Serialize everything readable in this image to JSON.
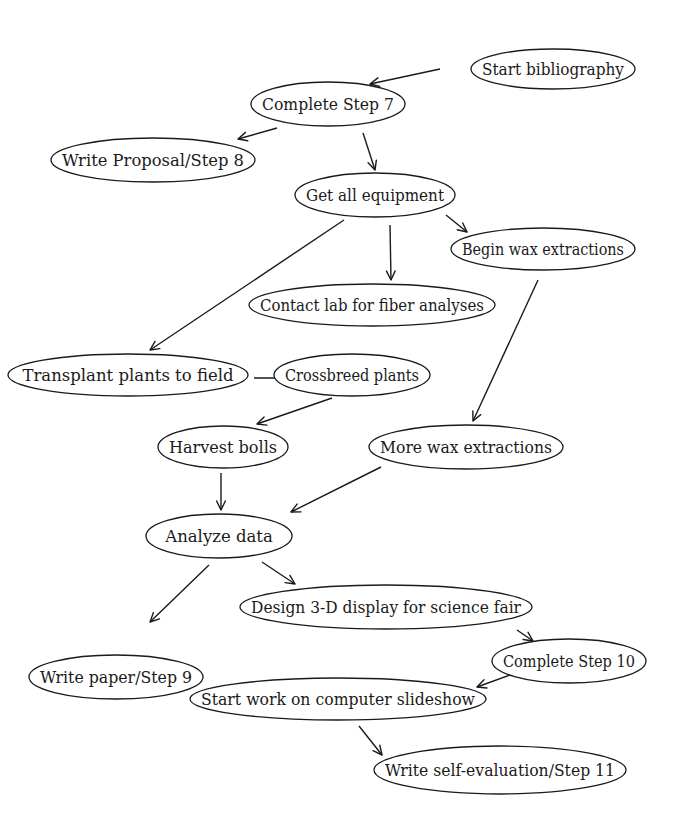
{
  "diagram": {
    "type": "flowchart",
    "colors": {
      "stroke": "#1a1a1a",
      "background": "#ffffff",
      "text": "#1a1a1a"
    },
    "nodes": [
      {
        "id": "start_bibliography",
        "label": "Start bibliography",
        "cx": 553,
        "cy": 69,
        "rx": 82,
        "ry": 20
      },
      {
        "id": "complete_step_7",
        "label": "Complete Step 7",
        "cx": 328,
        "cy": 104,
        "rx": 77,
        "ry": 22
      },
      {
        "id": "write_proposal_step_8",
        "label": "Write Proposal/Step 8",
        "cx": 153,
        "cy": 160,
        "rx": 102,
        "ry": 22
      },
      {
        "id": "get_all_equipment",
        "label": "Get all equipment",
        "cx": 375,
        "cy": 195,
        "rx": 80,
        "ry": 22
      },
      {
        "id": "begin_wax_extractions",
        "label": "Begin wax extractions",
        "cx": 543,
        "cy": 249,
        "rx": 92,
        "ry": 21
      },
      {
        "id": "contact_lab",
        "label": "Contact lab for fiber analyses",
        "cx": 372,
        "cy": 305,
        "rx": 123,
        "ry": 21
      },
      {
        "id": "transplant_plants",
        "label": "Transplant plants to field",
        "cx": 128,
        "cy": 375,
        "rx": 120,
        "ry": 21
      },
      {
        "id": "crossbreed_plants",
        "label": "Crossbreed plants",
        "cx": 352,
        "cy": 375,
        "rx": 78,
        "ry": 21
      },
      {
        "id": "harvest_bolls",
        "label": "Harvest bolls",
        "cx": 223,
        "cy": 447,
        "rx": 65,
        "ry": 21
      },
      {
        "id": "more_wax_extractions",
        "label": "More wax extractions",
        "cx": 466,
        "cy": 447,
        "rx": 97,
        "ry": 22
      },
      {
        "id": "analyze_data",
        "label": "Analyze data",
        "cx": 219,
        "cy": 536,
        "rx": 73,
        "ry": 22
      },
      {
        "id": "design_3d_display",
        "label": "Design 3-D display for science fair",
        "cx": 386,
        "cy": 607,
        "rx": 146,
        "ry": 22
      },
      {
        "id": "write_paper_step_9",
        "label": "Write paper/Step 9",
        "cx": 116,
        "cy": 677,
        "rx": 87,
        "ry": 22
      },
      {
        "id": "complete_step_10",
        "label": "Complete Step 10",
        "cx": 569,
        "cy": 661,
        "rx": 77,
        "ry": 22
      },
      {
        "id": "start_slideshow",
        "label": "Start work on computer slideshow",
        "cx": 338,
        "cy": 699,
        "rx": 148,
        "ry": 21
      },
      {
        "id": "write_self_evaluation",
        "label": "Write self-evaluation/Step 11",
        "cx": 500,
        "cy": 770,
        "rx": 126,
        "ry": 24
      }
    ],
    "edges": [
      {
        "from": "start_bibliography",
        "to": "complete_step_7",
        "x1": 440,
        "y1": 69,
        "x2": 370,
        "y2": 84
      },
      {
        "from": "complete_step_7",
        "to": "write_proposal_step_8",
        "x1": 277,
        "y1": 128,
        "x2": 238,
        "y2": 139
      },
      {
        "from": "complete_step_7",
        "to": "get_all_equipment",
        "x1": 363,
        "y1": 133,
        "x2": 375,
        "y2": 170
      },
      {
        "from": "get_all_equipment",
        "to": "begin_wax_extractions",
        "x1": 446,
        "y1": 215,
        "x2": 467,
        "y2": 232
      },
      {
        "from": "get_all_equipment",
        "to": "contact_lab",
        "x1": 390,
        "y1": 225,
        "x2": 391,
        "y2": 280
      },
      {
        "from": "get_all_equipment",
        "to": "transplant_plants",
        "x1": 344,
        "y1": 220,
        "x2": 150,
        "y2": 350
      },
      {
        "from": "transplant_plants",
        "to": "crossbreed_plants",
        "x1": 254,
        "y1": 378,
        "x2": 297,
        "y2": 378
      },
      {
        "from": "begin_wax_extractions",
        "to": "more_wax_extractions",
        "x1": 538,
        "y1": 280,
        "x2": 473,
        "y2": 421
      },
      {
        "from": "crossbreed_plants",
        "to": "harvest_bolls",
        "x1": 332,
        "y1": 398,
        "x2": 257,
        "y2": 424
      },
      {
        "from": "harvest_bolls",
        "to": "analyze_data",
        "x1": 221,
        "y1": 473,
        "x2": 221,
        "y2": 510
      },
      {
        "from": "more_wax_extractions",
        "to": "analyze_data",
        "x1": 381,
        "y1": 467,
        "x2": 291,
        "y2": 512
      },
      {
        "from": "analyze_data",
        "to": "write_paper_step_9",
        "x1": 209,
        "y1": 565,
        "x2": 150,
        "y2": 622
      },
      {
        "from": "analyze_data",
        "to": "design_3d_display",
        "x1": 262,
        "y1": 562,
        "x2": 295,
        "y2": 584
      },
      {
        "from": "design_3d_display",
        "to": "complete_step_10",
        "x1": 517,
        "y1": 630,
        "x2": 533,
        "y2": 641
      },
      {
        "from": "complete_step_10",
        "to": "start_slideshow",
        "x1": 513,
        "y1": 674,
        "x2": 477,
        "y2": 687
      },
      {
        "from": "start_slideshow",
        "to": "write_self_evaluation",
        "x1": 359,
        "y1": 726,
        "x2": 382,
        "y2": 755
      }
    ]
  }
}
